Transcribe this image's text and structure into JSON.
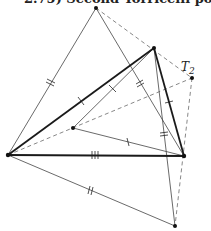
{
  "title": "2.75) Second Torricelli point",
  "labels": {
    "t2": "T",
    "t2_sub": "2"
  },
  "colors": {
    "ink": "#1a1a1a",
    "thin": "#555555",
    "dashed": "#888888"
  },
  "points": {
    "A": [
      96,
      8
    ],
    "B": [
      154,
      48
    ],
    "T2": [
      192,
      78
    ],
    "L": [
      8,
      155
    ],
    "C": [
      73,
      128
    ],
    "R": [
      184,
      156
    ],
    "D": [
      175,
      226
    ]
  }
}
